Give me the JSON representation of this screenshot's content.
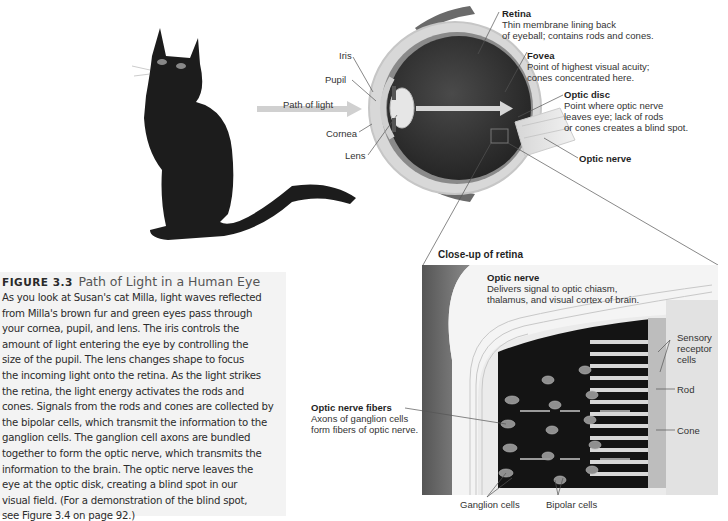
{
  "figure": {
    "number": "FIGURE 3.3",
    "title": "Path of Light in a Human Eye",
    "caption_lines": [
      "As you look at Susan's cat Milla, light waves reflected",
      "from Milla's brown fur and green eyes pass through",
      "your cornea, pupil, and lens. The iris controls the",
      "amount of light entering the eye by controlling the",
      "size of the pupil. The lens changes shape to focus",
      "the incoming light onto the retina. As the light strikes",
      "the retina, the light energy activates the rods and",
      "cones. Signals from the rods and cones are collected by",
      "the bipolar cells, which transmit the information to the",
      "ganglion cells. The ganglion cell axons are bundled",
      "together to form the optic nerve, which transmits the",
      "information to the brain. The optic nerve leaves the",
      "eye at the optic disk, creating a blind spot in our",
      "visual field. (For a demonstration of the blind spot,",
      "see Figure 3.4 on page 92.)"
    ]
  },
  "eye_labels": {
    "path_of_light": "Path of light",
    "iris": "Iris",
    "pupil": "Pupil",
    "cornea": "Cornea",
    "lens": "Lens",
    "retina": {
      "title": "Retina",
      "desc1": "Thin membrane lining back",
      "desc2": "of eyeball; contains rods and cones."
    },
    "fovea": {
      "title": "Fovea",
      "desc1": "Point of highest visual acuity;",
      "desc2": "cones concentrated here."
    },
    "optic_disc": {
      "title": "Optic disc",
      "desc1": "Point where optic nerve",
      "desc2": "leaves eye; lack of rods",
      "desc3": "or cones creates a blind spot."
    },
    "optic_nerve": "Optic nerve"
  },
  "closeup": {
    "title": "Close-up of retina",
    "optic_nerve": {
      "title": "Optic nerve",
      "desc1": "Delivers signal to optic chiasm,",
      "desc2": "thalamus, and visual cortex of brain."
    },
    "optic_nerve_fibers": {
      "title": "Optic nerve fibers",
      "desc1": "Axons of ganglion cells",
      "desc2": "form fibers of optic nerve."
    },
    "sensory_receptor": [
      "Sensory",
      "receptor",
      "cells"
    ],
    "rod": "Rod",
    "cone": "Cone",
    "ganglion": "Ganglion cells",
    "bipolar": "Bipolar cells"
  },
  "colors": {
    "caption_bg": "#f3f3f3",
    "eye_dark": "#2e2e2e",
    "sclera": "#d9d9d9",
    "closeup_bg": "#efefef",
    "closeup_dark": "#111111"
  }
}
